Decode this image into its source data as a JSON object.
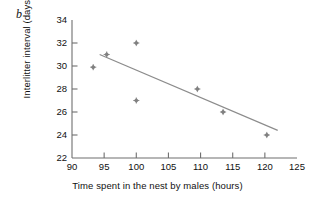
{
  "figure": {
    "panel_label": "b",
    "background_color": "#ffffff",
    "axis_color": "#6f6f6f",
    "marker_color": "#808080",
    "line_color": "#8c8c8c",
    "text_color": "#111111"
  },
  "chart_data": {
    "type": "scatter",
    "title": "",
    "subtitle": "",
    "xlabel": "Time spent in the nest by males (hours)",
    "ylabel": "Interlitter interval (days)",
    "xlim": [
      90,
      125
    ],
    "ylim": [
      22,
      34
    ],
    "xticks": [
      90,
      95,
      100,
      105,
      110,
      115,
      120,
      125
    ],
    "yticks": [
      22,
      24,
      26,
      28,
      30,
      32,
      34
    ],
    "xtick_labels": [
      "90",
      "95",
      "100",
      "105",
      "110",
      "115",
      "120",
      "125"
    ],
    "ytick_labels": [
      "22",
      "24",
      "26",
      "28",
      "30",
      "32",
      "34"
    ],
    "grid": false,
    "legend": null,
    "legend_position": "none",
    "annotations": [
      "b"
    ],
    "series": [
      {
        "name": "Observations",
        "marker": "diamond",
        "color": "#808080",
        "points": [
          {
            "x": 93.3,
            "y": 29.9
          },
          {
            "x": 95.4,
            "y": 31.0
          },
          {
            "x": 100.0,
            "y": 32.0
          },
          {
            "x": 100.0,
            "y": 27.0
          },
          {
            "x": 109.5,
            "y": 28.0
          },
          {
            "x": 113.5,
            "y": 26.0
          },
          {
            "x": 120.3,
            "y": 24.0
          }
        ]
      },
      {
        "name": "Regression line",
        "type": "line",
        "color": "#8c8c8c",
        "points": [
          {
            "x": 94.3,
            "y": 31.0
          },
          {
            "x": 122.0,
            "y": 24.4
          }
        ]
      }
    ]
  }
}
